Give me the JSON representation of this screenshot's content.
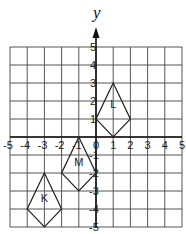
{
  "figure": {
    "axis_title_y": "y",
    "x_range": [
      -5,
      5
    ],
    "y_range": [
      -5,
      5
    ],
    "x_ticks": [
      "-5",
      "-4",
      "-3",
      "-2",
      "-1",
      "0",
      "1",
      "2",
      "3",
      "4",
      "5"
    ],
    "y_ticks": [
      "5",
      "4",
      "3",
      "2",
      "1",
      "-1",
      "-2",
      "-3",
      "-4",
      "-5"
    ],
    "grid": true,
    "colors": {
      "line": "#222222",
      "grid": "#555555",
      "background": "#ffffff"
    }
  },
  "shapes": [
    {
      "label": "L",
      "vertices": [
        [
          1,
          3
        ],
        [
          2,
          1
        ],
        [
          1,
          0
        ],
        [
          0,
          1
        ]
      ],
      "label_pos": [
        1,
        1.6
      ]
    },
    {
      "label": "M",
      "vertices": [
        [
          -1,
          0
        ],
        [
          0,
          -2
        ],
        [
          -1,
          -3
        ],
        [
          -2,
          -2
        ]
      ],
      "label_pos": [
        -1,
        -1.6
      ]
    },
    {
      "label": "K",
      "vertices": [
        [
          -3,
          -2
        ],
        [
          -2,
          -4
        ],
        [
          -3,
          -5
        ],
        [
          -4,
          -4
        ]
      ],
      "label_pos": [
        -3,
        -3.6
      ]
    }
  ]
}
